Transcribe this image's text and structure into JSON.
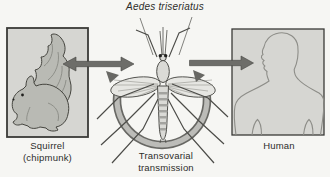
{
  "figure": {
    "title": "Aedes triseriatus",
    "nodes": {
      "squirrel": {
        "label_line1": "Squirrel",
        "label_line2": "(chipmunk)"
      },
      "human": {
        "label": "Human"
      },
      "mosquito": {
        "label_line1": "Transovarial",
        "label_line2": "transmission"
      }
    }
  },
  "colors": {
    "bg": "#f6f6f3",
    "text": "#2d2d2a",
    "box-fill": "#d6d6d2",
    "box-border": "#3a3a37",
    "arrow": "#6d6d69",
    "arrow-edge": "#454542",
    "line": "#4c4c48",
    "insect-fill": "#dadad6",
    "wing-fill": "#e6e6e2",
    "stripe": "#a3a39f",
    "arc-fill": "#bcbcb8",
    "arc-edge": "#686864",
    "squirrel-fill": "#b9bab4",
    "human-line": "#8d8d88",
    "eye": "#1f1f1d"
  }
}
